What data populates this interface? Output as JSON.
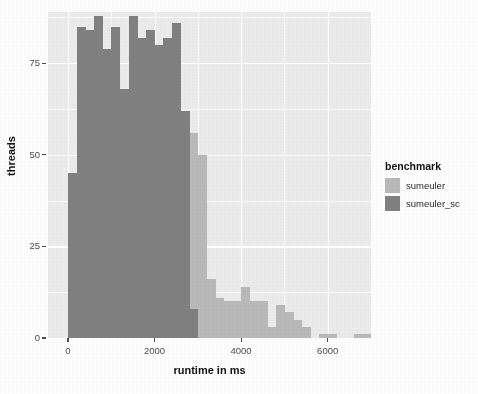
{
  "chart_data": {
    "type": "bar",
    "subtype": "histogram-overlaid",
    "title": "",
    "xlabel": "runtime in ms",
    "ylabel": "threads",
    "xlim": [
      -460,
      7000
    ],
    "ylim": [
      0,
      89
    ],
    "grid": true,
    "legend_position": "right",
    "legend_title": "benchmark",
    "binwidth": 200,
    "xticks": [
      0,
      2000,
      4000,
      6000
    ],
    "xtick_labels": [
      "0",
      "2000",
      "4000",
      "6000"
    ],
    "yticks": [
      0,
      25,
      50,
      75
    ],
    "ytick_labels": [
      "0",
      "25",
      "50",
      "75"
    ],
    "x_minor_ticks": [
      1000,
      3000,
      5000,
      7000
    ],
    "y_minor_ticks": [
      12.5,
      37.5,
      62.5,
      87.5
    ],
    "series": [
      {
        "name": "sumeuler",
        "color": "#b9b9b9",
        "bin_starts": [
          0,
          200,
          400,
          600,
          800,
          1000,
          1200,
          1400,
          1600,
          1800,
          2000,
          2200,
          2400,
          2600,
          2800,
          3000,
          3200,
          3400,
          3600,
          3800,
          4000,
          4200,
          4400,
          4600,
          4800,
          5000,
          5200,
          5400,
          5600,
          5800,
          6000,
          6200,
          6400,
          6600,
          6800
        ],
        "values": [
          45,
          85,
          84,
          88,
          79,
          85,
          68,
          88,
          82,
          84,
          80,
          82,
          86,
          62,
          56,
          50,
          16,
          11,
          10,
          10,
          14,
          10,
          10,
          3,
          9,
          7,
          5,
          3,
          0,
          1,
          1,
          0,
          0,
          1,
          1
        ]
      },
      {
        "name": "sumeuler_sc",
        "color": "#808080",
        "bin_starts": [
          0,
          200,
          400,
          600,
          800,
          1000,
          1200,
          1400,
          1600,
          1800,
          2000,
          2200,
          2400,
          2600,
          2800
        ],
        "values": [
          45,
          85,
          84,
          88,
          79,
          85,
          68,
          88,
          82,
          84,
          80,
          82,
          86,
          62,
          8
        ]
      }
    ]
  },
  "axes": {
    "x_title": "runtime in ms",
    "y_title": "threads"
  },
  "legend": {
    "title": "benchmark",
    "entries": [
      {
        "label": "sumeuler",
        "color": "#b9b9b9"
      },
      {
        "label": "sumeuler_sc",
        "color": "#808080"
      }
    ]
  },
  "theme": {
    "panel_background": "#ebebeb",
    "grid_color": "#ffffff",
    "text_color": "#4d4d4d",
    "page_background": "#fdfdfd"
  }
}
